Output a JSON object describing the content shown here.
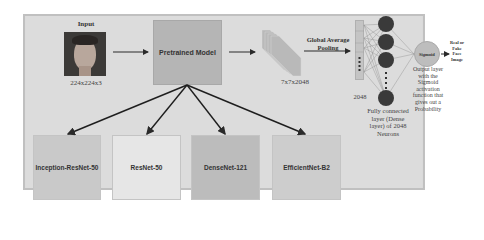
{
  "input": {
    "title": "Input",
    "dimension": "224x224x3",
    "image_alt": "face-photo"
  },
  "pretrained_model": {
    "label": "Pretrained Model",
    "color": "#b5b5b5"
  },
  "feature_map": {
    "dimension": "7x7x2048"
  },
  "pooling": {
    "label_line1": "Global Average",
    "label_line2": "Pooling"
  },
  "vector": {
    "dimension": "2048"
  },
  "dense_layer": {
    "caption_line1": "Fully connected",
    "caption_line2": "layer (Dense",
    "caption_line3": "layer) of 2048",
    "caption_line4": "Neurons"
  },
  "output": {
    "node_label": "Sigmoid",
    "result_line1": "Real or",
    "result_line2": "Fake",
    "result_line3": "Face",
    "result_line4": "Image",
    "caption_line1": "Output layer",
    "caption_line2": "with the",
    "caption_line3": "Sigmoid",
    "caption_line4": "activation",
    "caption_line5": "function that",
    "caption_line6": "gives out a",
    "caption_line7": "Probability"
  },
  "backbones": [
    {
      "label": "Inception-ResNet-50",
      "color": "#c9c9c9"
    },
    {
      "label": "ResNet-50",
      "color": "#e6e6e6"
    },
    {
      "label": "DenseNet-121",
      "color": "#bcbcbc"
    },
    {
      "label": "EfficientNet-B2",
      "color": "#cdcdcd"
    }
  ],
  "colors": {
    "background": "#dcdcdc",
    "neuron": "#3a3a3a",
    "sigmoid_node": "#bdbdbd",
    "arrow": "#2a2a2a"
  }
}
